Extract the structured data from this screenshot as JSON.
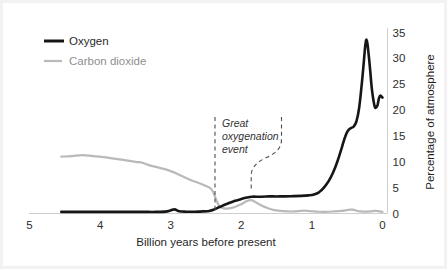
{
  "legend": {
    "items": [
      {
        "label": "Oxygen",
        "color": "#161616"
      },
      {
        "label": "Carbon dioxide",
        "color": "#b9b9b9"
      }
    ]
  },
  "annotation": {
    "lines": [
      "Great",
      "oxygenation",
      "event"
    ],
    "full_text": "Great oxygenation event",
    "x_range_billion_years": [
      2.4,
      1.85
    ]
  },
  "colors": {
    "oxygen_line": "#161616",
    "co2_line": "#b9b9b9",
    "axis_line": "#cfcfcf",
    "dashed_annotation": "#4d4d4d"
  },
  "chart_data": {
    "type": "line",
    "title": "",
    "xlabel": "Billion years before present",
    "ylabel": "Percentage of atmosphere",
    "xlim": [
      5,
      0
    ],
    "ylim": [
      0,
      35
    ],
    "x_ticks": [
      5,
      4,
      3,
      2,
      1,
      0
    ],
    "y_ticks": [
      0,
      5,
      10,
      15,
      20,
      25,
      30,
      35
    ],
    "grid": false,
    "legend_position": "top-left",
    "y_axis_side": "right",
    "series": [
      {
        "name": "Carbon dioxide",
        "color": "#b9b9b9",
        "width": 2.2,
        "points": [
          [
            4.55,
            11.0
          ],
          [
            4.4,
            11.1
          ],
          [
            4.25,
            11.3
          ],
          [
            4.1,
            11.1
          ],
          [
            3.95,
            10.9
          ],
          [
            3.8,
            10.6
          ],
          [
            3.65,
            10.3
          ],
          [
            3.5,
            10.0
          ],
          [
            3.4,
            9.8
          ],
          [
            3.3,
            9.3
          ],
          [
            3.15,
            8.8
          ],
          [
            3.0,
            8.2
          ],
          [
            2.85,
            7.3
          ],
          [
            2.7,
            6.4
          ],
          [
            2.6,
            5.9
          ],
          [
            2.5,
            5.3
          ],
          [
            2.44,
            4.9
          ],
          [
            2.4,
            4.2
          ],
          [
            2.36,
            2.8
          ],
          [
            2.32,
            1.6
          ],
          [
            2.28,
            1.1
          ],
          [
            2.2,
            0.95
          ],
          [
            2.1,
            1.2
          ],
          [
            2.0,
            1.8
          ],
          [
            1.92,
            2.4
          ],
          [
            1.86,
            2.6
          ],
          [
            1.8,
            2.2
          ],
          [
            1.72,
            1.6
          ],
          [
            1.64,
            1.1
          ],
          [
            1.55,
            0.7
          ],
          [
            1.45,
            0.5
          ],
          [
            1.35,
            0.4
          ],
          [
            1.25,
            0.4
          ],
          [
            1.12,
            0.55
          ],
          [
            1.02,
            0.45
          ],
          [
            0.92,
            0.35
          ],
          [
            0.8,
            0.3
          ],
          [
            0.68,
            0.4
          ],
          [
            0.58,
            0.5
          ],
          [
            0.48,
            0.7
          ],
          [
            0.42,
            0.75
          ],
          [
            0.34,
            0.45
          ],
          [
            0.26,
            0.35
          ],
          [
            0.18,
            0.4
          ],
          [
            0.1,
            0.5
          ],
          [
            0.04,
            0.4
          ],
          [
            0.0,
            0.3
          ]
        ]
      },
      {
        "name": "Oxygen",
        "color": "#161616",
        "width": 2.6,
        "points": [
          [
            4.55,
            0.3
          ],
          [
            4.3,
            0.3
          ],
          [
            4.0,
            0.3
          ],
          [
            3.7,
            0.3
          ],
          [
            3.4,
            0.3
          ],
          [
            3.2,
            0.3
          ],
          [
            3.05,
            0.4
          ],
          [
            2.95,
            0.8
          ],
          [
            2.88,
            0.45
          ],
          [
            2.78,
            0.35
          ],
          [
            2.65,
            0.35
          ],
          [
            2.55,
            0.4
          ],
          [
            2.45,
            0.5
          ],
          [
            2.38,
            0.8
          ],
          [
            2.3,
            1.3
          ],
          [
            2.2,
            1.9
          ],
          [
            2.1,
            2.4
          ],
          [
            2.0,
            2.8
          ],
          [
            1.92,
            3.1
          ],
          [
            1.85,
            3.25
          ],
          [
            1.75,
            3.25
          ],
          [
            1.6,
            3.3
          ],
          [
            1.45,
            3.3
          ],
          [
            1.3,
            3.35
          ],
          [
            1.15,
            3.4
          ],
          [
            1.05,
            3.5
          ],
          [
            0.97,
            3.7
          ],
          [
            0.9,
            4.1
          ],
          [
            0.83,
            5.0
          ],
          [
            0.76,
            6.3
          ],
          [
            0.7,
            7.9
          ],
          [
            0.64,
            10.0
          ],
          [
            0.58,
            12.6
          ],
          [
            0.53,
            14.8
          ],
          [
            0.49,
            16.0
          ],
          [
            0.45,
            16.5
          ],
          [
            0.41,
            16.8
          ],
          [
            0.37,
            17.8
          ],
          [
            0.33,
            20.5
          ],
          [
            0.29,
            25.5
          ],
          [
            0.26,
            30.0
          ],
          [
            0.24,
            33.0
          ],
          [
            0.225,
            33.6
          ],
          [
            0.21,
            32.5
          ],
          [
            0.18,
            28.5
          ],
          [
            0.15,
            24.0
          ],
          [
            0.12,
            21.3
          ],
          [
            0.1,
            20.4
          ],
          [
            0.07,
            21.0
          ],
          [
            0.05,
            22.3
          ],
          [
            0.03,
            22.8
          ],
          [
            0.0,
            22.4
          ]
        ]
      }
    ]
  }
}
